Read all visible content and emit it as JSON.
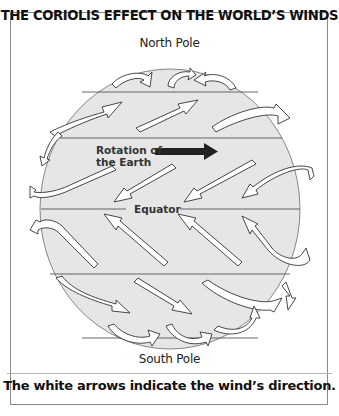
{
  "title": "THE CORIOLIS EFFECT ON THE WORLD’S WINDS",
  "labels": {
    "north_pole": "North Pole",
    "south_pole": "South Pole",
    "rotation_line1": "Rotation of",
    "rotation_line2": "the Earth",
    "equator": "Equator"
  },
  "caption": "The white arrows indicate the wind’s direction.",
  "colors": {
    "globe_fill": "#e6e6e6",
    "line": "#555555",
    "arrow_fill": "#ffffff",
    "rotation_arrow": "#222222"
  },
  "arrows": {
    "north_polar_easterlies": "curl westward near North Pole",
    "northern_westerlies": "southwest-to-northeast",
    "northern_trade_winds": "northeast-to-southwest toward equator",
    "southern_trade_winds": "southeast-to-northwest toward equator",
    "southern_westerlies": "northwest-to-southeast",
    "south_polar_easterlies": "curl westward near South Pole"
  }
}
